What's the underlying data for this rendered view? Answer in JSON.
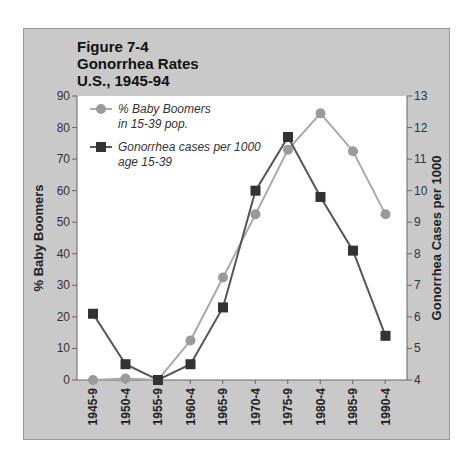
{
  "title": {
    "line1": "Figure 7-4",
    "line2": "Gonorrhea Rates",
    "line3": "U.S., 1945-94"
  },
  "colors": {
    "frame_bg": "#c9c9c9",
    "plot_bg": "#ffffff",
    "boomers": "#9a9a9a",
    "boomers_line": "#aaaaaa",
    "gonorrhea": "#333333",
    "gonorrhea_line": "#555555"
  },
  "legend": {
    "boomers_l1": "% Baby Boomers",
    "boomers_l2": "in 15-39 pop.",
    "gonorrhea_l1": "Gonorrhea cases per 1000",
    "gonorrhea_l2": "age 15-39"
  },
  "axes": {
    "left_label": "% Baby Boomers",
    "right_label": "Gonorrhea Cases per 1000"
  },
  "chart_data": {
    "type": "line",
    "title": "Figure 7-4 Gonorrhea Rates U.S., 1945-94",
    "xlabel": "",
    "categories": [
      "1945-9",
      "1950-4",
      "1955-9",
      "1960-4",
      "1965-9",
      "1970-4",
      "1975-9",
      "1980-4",
      "1985-9",
      "1990-4"
    ],
    "series": [
      {
        "name": "% Baby Boomers in 15-39 pop.",
        "axis": "left",
        "marker": "circle",
        "values": [
          0,
          0.5,
          0,
          12.5,
          32.5,
          52.5,
          73,
          84.5,
          72.5,
          52.5
        ]
      },
      {
        "name": "Gonorrhea cases per 1000 age 15-39",
        "axis": "right",
        "marker": "square",
        "values": [
          6.1,
          4.5,
          4.0,
          4.5,
          6.3,
          10.0,
          11.7,
          9.8,
          8.1,
          5.4
        ]
      }
    ],
    "ylabel_left": "% Baby Boomers",
    "ylim_left": [
      0,
      90
    ],
    "yticks_left": [
      0,
      10,
      20,
      30,
      40,
      50,
      60,
      70,
      80,
      90
    ],
    "ylabel_right": "Gonorrhea Cases per 1000",
    "ylim_right": [
      4,
      13
    ],
    "yticks_right": [
      4,
      5,
      6,
      7,
      8,
      9,
      10,
      11,
      12,
      13
    ],
    "grid": false,
    "legend_position": "upper-left inside plot"
  }
}
